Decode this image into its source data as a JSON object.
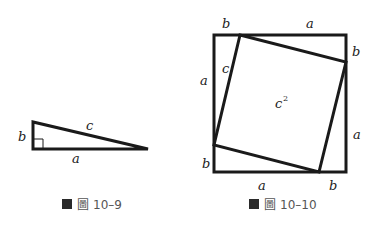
{
  "colors": {
    "stroke": "#1a1a1a",
    "label": "#222222",
    "caption": "#555555",
    "caption_box": "#2a2a2a",
    "caption_glyph": "#888888"
  },
  "figure_10_9": {
    "caption_prefix": "圖",
    "caption_number": "10–9",
    "labels": {
      "hypotenuse": "c",
      "vertical_leg": "b",
      "horizontal_leg": "a"
    }
  },
  "figure_10_10": {
    "caption_prefix": "圖",
    "caption_number": "10–10",
    "labels": {
      "top_left": "b",
      "top_right": "a",
      "right_top": "b",
      "right_bottom": "a",
      "bottom_right": "b",
      "bottom_left": "a",
      "left_bottom": "b",
      "left_top": "a",
      "inner_side": "c",
      "area": "c",
      "area_exponent": "2"
    }
  }
}
